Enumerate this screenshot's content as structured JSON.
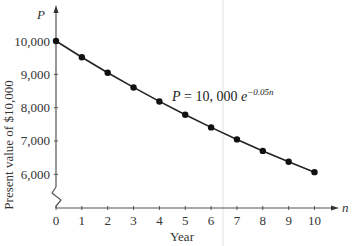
{
  "chart_data": {
    "type": "line",
    "title": "",
    "xlabel": "Year",
    "ylabel": "Present value of $10,000",
    "x_axis_symbol": "n",
    "y_axis_symbol": "P",
    "x": [
      0,
      1,
      2,
      3,
      4,
      5,
      6,
      7,
      8,
      9,
      10
    ],
    "series": [
      {
        "name": "P = 10,000 e^{-0.05n}",
        "values": [
          10000,
          9512,
          9048,
          8607,
          8187,
          7788,
          7408,
          7047,
          6703,
          6376,
          6065
        ]
      }
    ],
    "x_ticks": [
      "0",
      "1",
      "2",
      "3",
      "4",
      "5",
      "6",
      "7",
      "8",
      "9",
      "10"
    ],
    "y_ticks": [
      "6,000",
      "7,000",
      "8,000",
      "9,000",
      "10,000"
    ],
    "ylim": [
      6000,
      10000
    ],
    "xlim": [
      0,
      10
    ],
    "axis_break": true,
    "grid": false,
    "annotation": {
      "lhs": "P = 10, 000",
      "base": "e",
      "exponent": "−0.05n"
    },
    "colors": {
      "line": "#222222",
      "axis": "#555555",
      "marker": "#111111"
    }
  }
}
